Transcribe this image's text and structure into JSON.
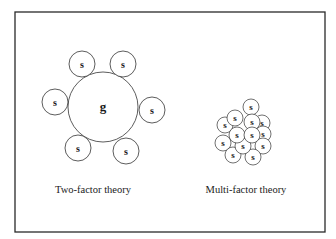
{
  "figure": {
    "two_factor": {
      "label": "Two-factor theory",
      "general_factor": "g",
      "specific_factor": "s"
    },
    "multi_factor": {
      "label": "Multi-factor theory",
      "specific_factor": "s"
    },
    "colors": {
      "stroke": "#2a2a2a",
      "background": "#ffffff"
    }
  }
}
